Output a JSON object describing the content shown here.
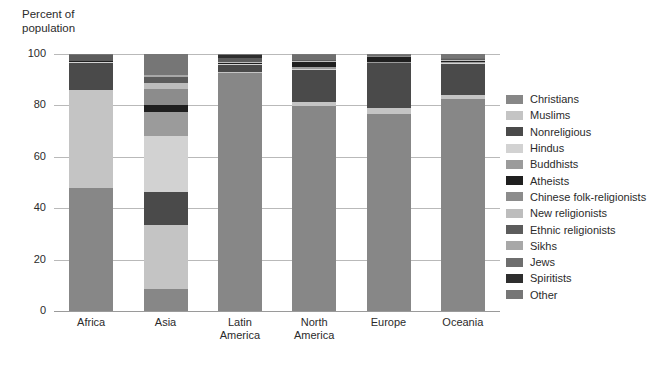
{
  "chart_data": {
    "type": "bar",
    "title": "",
    "subtitle": "",
    "ylabel": "Percent of\npopulation",
    "xlabel": "",
    "ylim": [
      0,
      100
    ],
    "yticks": [
      0,
      20,
      40,
      60,
      80,
      100
    ],
    "ytick_labels": [
      "0",
      "20",
      "40",
      "60",
      "80",
      "100"
    ],
    "grid": true,
    "stacked": true,
    "legend_position": "right",
    "categories": [
      "Africa",
      "Asia",
      "Latin\nAmerica",
      "North\nAmerica",
      "Europe",
      "Oceania"
    ],
    "series": [
      {
        "name": "Christians",
        "color": "#878787",
        "values": [
          48.0,
          8.5,
          92.5,
          80.5,
          76.5,
          82.5
        ]
      },
      {
        "name": "Muslims",
        "color": "#c4c4c4",
        "values": [
          38.0,
          25.0,
          0.4,
          1.6,
          2.5,
          1.5
        ]
      },
      {
        "name": "Nonreligious",
        "color": "#4a4a4a",
        "values": [
          10.5,
          13.0,
          2.8,
          12.5,
          17.5,
          12.0
        ]
      },
      {
        "name": "Hindus",
        "color": "#d2d2d2",
        "values": [
          0.3,
          21.5,
          0.3,
          0.5,
          0.2,
          0.4
        ]
      },
      {
        "name": "Buddhists",
        "color": "#9b9b9b",
        "values": [
          0.1,
          9.5,
          0.2,
          1.0,
          0.3,
          0.4
        ]
      },
      {
        "name": "Atheists",
        "color": "#1f1f1f",
        "values": [
          0.2,
          2.8,
          0.4,
          1.6,
          2.0,
          0.4
        ]
      },
      {
        "name": "Chinese folk-religionists",
        "color": "#8c8c8c",
        "values": [
          0.0,
          6.2,
          0.1,
          0.2,
          0.1,
          0.2
        ]
      },
      {
        "name": "New religionists",
        "color": "#bdbdbd",
        "values": [
          0.0,
          2.3,
          0.1,
          0.4,
          0.1,
          0.3
        ]
      },
      {
        "name": "Ethnic religionists",
        "color": "#5c5c5c",
        "values": [
          2.5,
          2.4,
          1.5,
          0.2,
          0.1,
          0.4
        ]
      },
      {
        "name": "Sikhs",
        "color": "#a8a8a8",
        "values": [
          0.0,
          0.6,
          0.0,
          0.2,
          0.1,
          0.1
        ]
      },
      {
        "name": "Jews",
        "color": "#6e6e6e",
        "values": [
          0.2,
          0.1,
          0.2,
          1.8,
          0.3,
          0.3
        ]
      },
      {
        "name": "Spiritists",
        "color": "#2e2e2e",
        "values": [
          0.0,
          0.0,
          1.3,
          0.1,
          0.1,
          0.1
        ]
      },
      {
        "name": "Other",
        "color": "#767676",
        "values": [
          0.2,
          8.1,
          0.2,
          0.4,
          0.2,
          1.4
        ]
      }
    ]
  },
  "legend": {
    "items": [
      {
        "label": "Christians",
        "color": "#878787"
      },
      {
        "label": "Muslims",
        "color": "#c4c4c4"
      },
      {
        "label": "Nonreligious",
        "color": "#4a4a4a"
      },
      {
        "label": "Hindus",
        "color": "#d2d2d2"
      },
      {
        "label": "Buddhists",
        "color": "#9b9b9b"
      },
      {
        "label": "Atheists",
        "color": "#1f1f1f"
      },
      {
        "label": "Chinese folk-religionists",
        "color": "#8c8c8c"
      },
      {
        "label": "New religionists",
        "color": "#bdbdbd"
      },
      {
        "label": "Ethnic religionists",
        "color": "#5c5c5c"
      },
      {
        "label": "Sikhs",
        "color": "#a8a8a8"
      },
      {
        "label": "Jews",
        "color": "#6e6e6e"
      },
      {
        "label": "Spiritists",
        "color": "#2e2e2e"
      },
      {
        "label": "Other",
        "color": "#767676"
      }
    ]
  },
  "axis": {
    "y_title": "Percent of\npopulation"
  }
}
